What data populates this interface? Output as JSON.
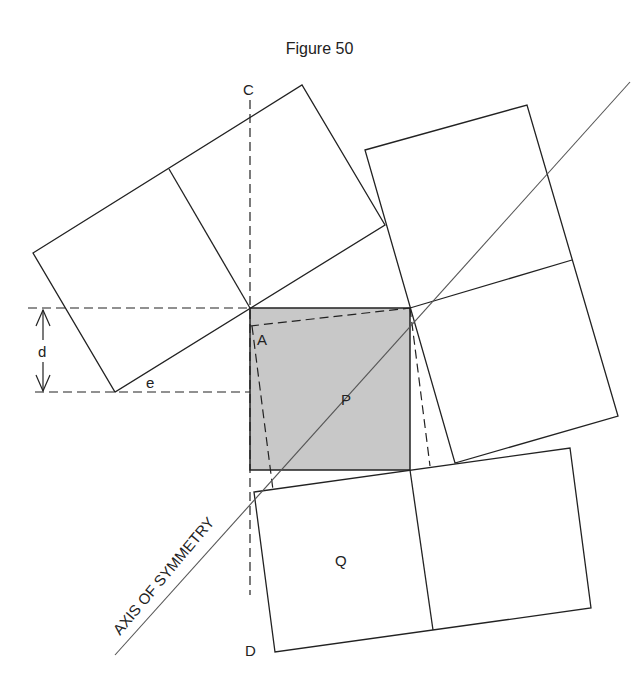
{
  "title": "Figure 50",
  "labels": {
    "C": "C",
    "D": "D",
    "A": "A",
    "P": "P",
    "Q": "Q",
    "d": "d",
    "e": "e",
    "axis": "AXIS OF SYMMETRY"
  },
  "colors": {
    "line": "#222222",
    "square_fill": "#c8c8c8",
    "axis_line": "#666666"
  },
  "shapes": {
    "central_square": "P (shaded square)",
    "rectangles": [
      "top-left 2-square rectangle",
      "right 2-square rectangle",
      "bottom 2-square rectangle containing Q"
    ]
  }
}
